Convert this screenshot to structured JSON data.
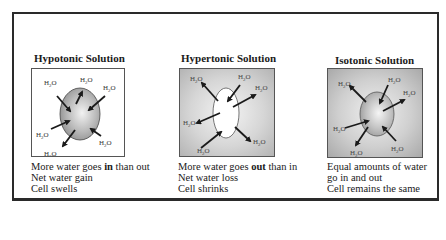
{
  "panels": [
    {
      "id": "hypotonic",
      "title": "Hypotonic Solution",
      "water_labels": [
        "H₂O",
        "H₂O",
        "H₂O",
        "H₂O",
        "H₂O",
        "H₂O"
      ],
      "cell_state": "swollen",
      "desc": {
        "line1_pre": "More water goes ",
        "line1_bold": "in",
        "line1_post": " than out",
        "line2": "Net water gain",
        "line3": "Cell swells"
      }
    },
    {
      "id": "hypertonic",
      "title": "Hypertonic Solution",
      "water_labels": [
        "H₂O",
        "H₂O",
        "H₂O",
        "H₂O",
        "H₂O",
        "H₂O"
      ],
      "cell_state": "shrunken",
      "desc": {
        "line1_pre": "More water goes ",
        "line1_bold": "out",
        "line1_post": " than in",
        "line2": "Net water loss",
        "line3": "Cell shrinks"
      }
    },
    {
      "id": "isotonic",
      "title": "Isotonic Solution",
      "water_labels": [
        "H₂O",
        "H₂O",
        "H₂O",
        "H₂O",
        "H₂O",
        "H₂O"
      ],
      "cell_state": "normal",
      "desc": {
        "line1": "Equal amounts of water",
        "line2": "go in and out",
        "line3": "Cell remains the same"
      }
    }
  ]
}
